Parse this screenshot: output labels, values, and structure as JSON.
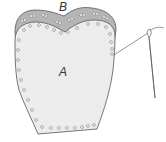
{
  "diagram": {
    "type": "sewing-illustration",
    "labels": {
      "outer_piece": "B",
      "inner_piece": "A"
    },
    "colors": {
      "piece_b_fill": "#b5b5b5",
      "piece_a_fill": "#ececec",
      "outline": "#555555",
      "holes": "#777777",
      "thread": "#666666"
    },
    "elements": [
      {
        "name": "piece-b",
        "description": "outer heart-shaped layer with paired stitch holes"
      },
      {
        "name": "piece-a",
        "description": "inner shoe-upper-shaped piece with single stitch holes around perimeter"
      },
      {
        "name": "needle-and-thread",
        "description": "needle with thread entering a hole on the right edge of piece A"
      }
    ]
  }
}
